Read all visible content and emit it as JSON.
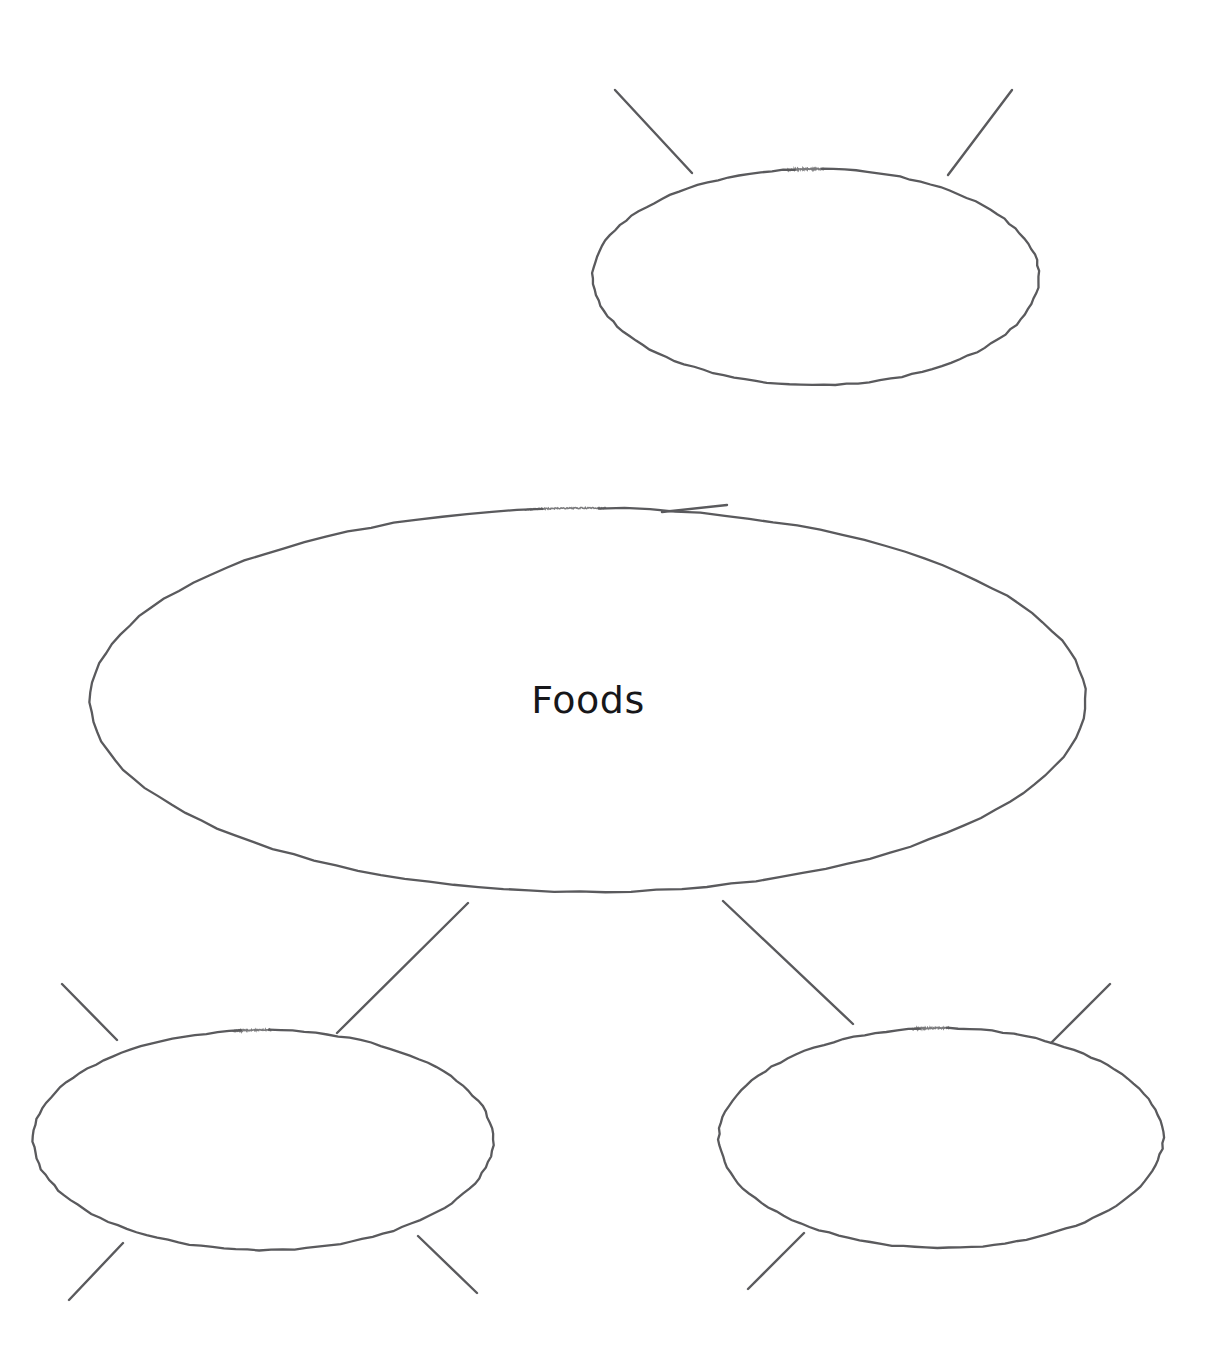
{
  "document": {
    "kind": "bubble-map-graphic-organizer",
    "background_color": "#ffffff",
    "stroke_color": "#5a5a5d",
    "text_color": "#17171a",
    "canvas": {
      "width": 1231,
      "height": 1371
    }
  },
  "nodes": [
    {
      "id": "center",
      "name": "center-bubble",
      "label": "Foods",
      "label_visible": true,
      "cx": 588,
      "cy": 700,
      "rx": 498,
      "ry": 192,
      "gap_angle_deg": -90,
      "gap_width_deg": 2.5
    },
    {
      "id": "top",
      "name": "top-bubble",
      "label": "",
      "label_visible": false,
      "cx": 816,
      "cy": 277,
      "rx": 223,
      "ry": 108,
      "gap_angle_deg": -90,
      "gap_width_deg": 3
    },
    {
      "id": "bottom-left",
      "name": "bottom-left-bubble",
      "label": "",
      "label_visible": false,
      "cx": 263,
      "cy": 1140,
      "rx": 230,
      "ry": 110,
      "gap_angle_deg": -90,
      "gap_width_deg": 3
    },
    {
      "id": "bottom-right",
      "name": "bottom-right-bubble",
      "label": "",
      "label_visible": false,
      "cx": 941,
      "cy": 1138,
      "rx": 222,
      "ry": 110,
      "gap_angle_deg": -90,
      "gap_width_deg": 3
    }
  ],
  "connectors": [
    {
      "name": "connector-center-to-top",
      "x1": 727,
      "y1": 505,
      "x2": 662,
      "y2": 512
    },
    {
      "name": "connector-top-upper-left",
      "x1": 615,
      "y1": 90,
      "x2": 692,
      "y2": 173
    },
    {
      "name": "connector-top-upper-right",
      "x1": 1012,
      "y1": 90,
      "x2": 948,
      "y2": 175
    },
    {
      "name": "connector-center-to-bottom-left",
      "x1": 468,
      "y1": 903,
      "x2": 337,
      "y2": 1033
    },
    {
      "name": "connector-center-to-bottom-right",
      "x1": 723,
      "y1": 901,
      "x2": 853,
      "y2": 1024
    },
    {
      "name": "connector-bottom-left-upper-left",
      "x1": 62,
      "y1": 984,
      "x2": 117,
      "y2": 1040
    },
    {
      "name": "connector-bottom-left-lower-left",
      "x1": 69,
      "y1": 1300,
      "x2": 123,
      "y2": 1243
    },
    {
      "name": "connector-bottom-left-lower-right",
      "x1": 477,
      "y1": 1293,
      "x2": 418,
      "y2": 1236
    },
    {
      "name": "connector-bottom-right-upper-right",
      "x1": 1110,
      "y1": 984,
      "x2": 1051,
      "y2": 1043
    },
    {
      "name": "connector-bottom-right-lower-left",
      "x1": 748,
      "y1": 1289,
      "x2": 804,
      "y2": 1233
    }
  ],
  "labels": {
    "center_text": "Foods"
  }
}
